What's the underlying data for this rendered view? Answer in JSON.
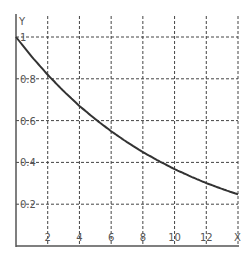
{
  "chart_data": {
    "type": "line",
    "title": "",
    "xlabel": "X",
    "ylabel": "Y",
    "xlim": [
      0,
      14
    ],
    "ylim": [
      0,
      1.0
    ],
    "grid": true,
    "x_ticks": [
      "2",
      "4",
      "6",
      "8",
      "10",
      "12"
    ],
    "y_ticks": [
      "0.2",
      "0.4",
      "0.6",
      "0.8",
      "1"
    ],
    "series": [
      {
        "name": "y = e^(-0.1x)",
        "x": [
          0,
          1,
          2,
          3,
          4,
          5,
          6,
          7,
          8,
          9,
          10,
          11,
          12,
          13,
          14
        ],
        "y": [
          1.0,
          0.905,
          0.819,
          0.741,
          0.67,
          0.607,
          0.549,
          0.497,
          0.449,
          0.407,
          0.368,
          0.333,
          0.301,
          0.273,
          0.247
        ]
      }
    ],
    "colors": {
      "curve": "#333333",
      "grid": "#444444",
      "axis": "#555555"
    }
  }
}
